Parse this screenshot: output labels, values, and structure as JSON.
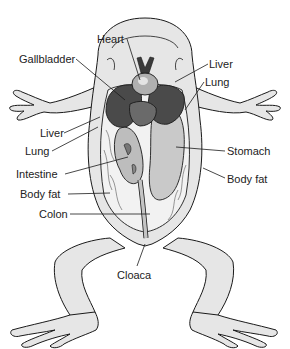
{
  "diagram": {
    "labels": [
      {
        "id": "heart",
        "text": "Heart",
        "x": 97,
        "y": 33,
        "target": [
          140,
          80
        ]
      },
      {
        "id": "gallbladder",
        "text": "Gallbladder",
        "x": 19,
        "y": 53,
        "target": [
          125,
          100
        ]
      },
      {
        "id": "liver-right",
        "text": "Liver",
        "x": 209,
        "y": 58,
        "target": [
          175,
          80
        ]
      },
      {
        "id": "lung-right",
        "text": "Lung",
        "x": 205,
        "y": 76,
        "target": [
          185,
          110
        ]
      },
      {
        "id": "liver-left",
        "text": "Liver",
        "x": 40,
        "y": 127,
        "target": [
          100,
          117
        ]
      },
      {
        "id": "lung-left",
        "text": "Lung",
        "x": 25,
        "y": 145,
        "target": [
          98,
          127
        ]
      },
      {
        "id": "intestine",
        "text": "Intestine",
        "x": 16,
        "y": 168,
        "target": [
          128,
          157
        ]
      },
      {
        "id": "stomach",
        "text": "Stomach",
        "x": 227,
        "y": 145,
        "target": [
          176,
          147
        ]
      },
      {
        "id": "body-fat-right",
        "text": "Body fat",
        "x": 227,
        "y": 173,
        "target": [
          203,
          168
        ]
      },
      {
        "id": "body-fat-left",
        "text": "Body fat",
        "x": 20,
        "y": 188,
        "target": [
          110,
          193
        ]
      },
      {
        "id": "colon",
        "text": "Colon",
        "x": 39,
        "y": 208,
        "target": [
          150,
          214
        ]
      },
      {
        "id": "cloaca",
        "text": "Cloaca",
        "x": 117,
        "y": 269,
        "target": [
          145,
          244
        ]
      }
    ],
    "colors": {
      "skin": "#e6e6e6",
      "outline": "#1a1a1a",
      "liver": "#4a4a4a",
      "liver_light": "#6a6a6a",
      "stomach": "#c9c9c9",
      "intestine": "#bdbdbd",
      "fat": "#f2f2f2",
      "heart": "#b0b0b0",
      "vessel": "#3a3a3a"
    }
  }
}
